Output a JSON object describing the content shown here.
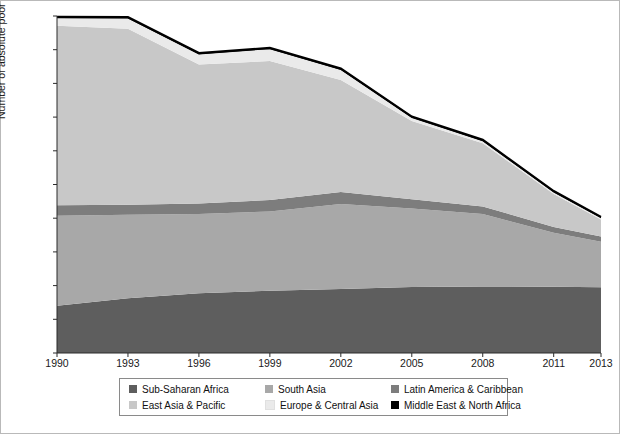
{
  "chart_data": {
    "type": "area",
    "stacked": true,
    "title": "",
    "xlabel": "",
    "ylabel": "Number of absolute poor (in millions)",
    "x": [
      1990,
      1993,
      1996,
      1999,
      2002,
      2005,
      2008,
      2011,
      2013
    ],
    "xtick_labels": [
      "1990",
      "1993",
      "1996",
      "1999",
      "2002",
      "2005",
      "2008",
      "2011",
      "2013"
    ],
    "xlim": [
      1990,
      2013
    ],
    "ylim": [
      0,
      2000
    ],
    "ytick_labels": [
      "0",
      "200",
      "400",
      "600",
      "800",
      "1000",
      "1200",
      "1400",
      "1600",
      "1800",
      "2000"
    ],
    "yticks": [
      0,
      200,
      400,
      600,
      800,
      1000,
      1200,
      1400,
      1600,
      1800,
      2000
    ],
    "ytick_step": 200,
    "grid": false,
    "legend_position": "bottom",
    "series": [
      {
        "name": "Sub-Saharan Africa",
        "color": "#5e5e5e",
        "values": [
          280,
          325,
          355,
          370,
          380,
          392,
          395,
          393,
          390
        ]
      },
      {
        "name": "South Asia",
        "color": "#a8a8a8",
        "values": [
          535,
          495,
          470,
          470,
          505,
          465,
          430,
          320,
          270
        ]
      },
      {
        "name": "Latin America & Caribbean",
        "color": "#7d7d7d",
        "values": [
          62,
          60,
          62,
          68,
          70,
          55,
          45,
          35,
          32
        ]
      },
      {
        "name": "East Asia & Pacific",
        "color": "#c8c8c8",
        "values": [
          1065,
          1045,
          825,
          825,
          665,
          465,
          375,
          195,
          100
        ]
      },
      {
        "name": "Europe & Central Asia",
        "color": "#eaeaea",
        "values": [
          45,
          60,
          60,
          70,
          60,
          18,
          12,
          10,
          8
        ]
      },
      {
        "name": "Middle East & North Africa",
        "color": "#000000",
        "values": [
          8,
          8,
          8,
          8,
          8,
          8,
          8,
          8,
          8
        ]
      }
    ],
    "totals": [
      1995,
      1993,
      1780,
      1811,
      1688,
      1403,
      1265,
      961,
      808
    ],
    "legend_entries": [
      {
        "label": "Sub-Saharan Africa",
        "color": "#5e5e5e"
      },
      {
        "label": "South Asia",
        "color": "#a8a8a8"
      },
      {
        "label": "Latin America & Caribbean",
        "color": "#7d7d7d"
      },
      {
        "label": "East Asia & Pacific",
        "color": "#c8c8c8"
      },
      {
        "label": "Europe & Central Asia",
        "color": "#eaeaea"
      },
      {
        "label": "Middle East & North Africa",
        "color": "#000000"
      }
    ]
  }
}
